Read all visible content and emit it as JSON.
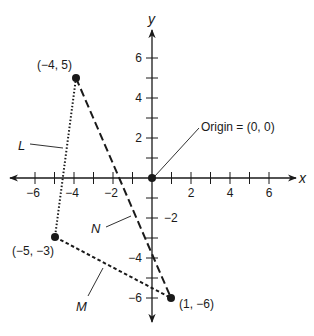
{
  "diagram": {
    "axes": {
      "x_label": "x",
      "y_label": "y",
      "x_ticks": [
        -6,
        -5,
        -4,
        -3,
        -2,
        -1,
        1,
        2,
        3,
        4,
        5,
        6
      ],
      "y_ticks": [
        -6,
        -5,
        -4,
        -3,
        -2,
        -1,
        1,
        2,
        3,
        4,
        5,
        6
      ],
      "x_tick_labels": [
        {
          "value": -6,
          "text": "−6"
        },
        {
          "value": -4,
          "text": "−4"
        },
        {
          "value": -2,
          "text": "−2"
        },
        {
          "value": 2,
          "text": "2"
        },
        {
          "value": 4,
          "text": "4"
        },
        {
          "value": 6,
          "text": "6"
        }
      ],
      "y_tick_labels": [
        {
          "value": 6,
          "text": "6"
        },
        {
          "value": 4,
          "text": "4"
        },
        {
          "value": 2,
          "text": "2"
        },
        {
          "value": -2,
          "text": "−2"
        },
        {
          "value": -4,
          "text": "−4"
        },
        {
          "value": -6,
          "text": "−6"
        }
      ]
    },
    "origin_label": "Origin = (0, 0)",
    "points": [
      {
        "id": "A",
        "x": -4,
        "y": 5,
        "label": "(−4, 5)"
      },
      {
        "id": "B",
        "x": -5,
        "y": -3,
        "label": "(−5, −3)"
      },
      {
        "id": "C",
        "x": 1,
        "y": -6,
        "label": "(1, −6)"
      }
    ],
    "segments": [
      {
        "name": "L",
        "from": "A",
        "to": "B",
        "style": "dotted"
      },
      {
        "name": "M",
        "from": "B",
        "to": "C",
        "style": "short-dashed"
      },
      {
        "name": "N",
        "from": "A",
        "to": "C",
        "style": "long-dashed"
      }
    ],
    "colors": {
      "ink": "#1a1a1a",
      "background": "#ffffff"
    }
  }
}
